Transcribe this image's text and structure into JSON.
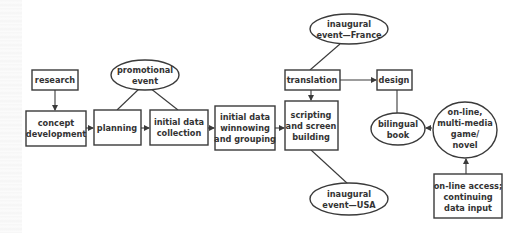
{
  "diagram": {
    "nodes": {
      "research": {
        "shape": "box",
        "lines": [
          "research"
        ]
      },
      "concept_development": {
        "shape": "box",
        "lines": [
          "concept",
          "development"
        ]
      },
      "promotional_event": {
        "shape": "ellipse",
        "lines": [
          "promotional",
          "event"
        ]
      },
      "planning": {
        "shape": "box",
        "lines": [
          "planning"
        ]
      },
      "initial_data_collection": {
        "shape": "box",
        "lines": [
          "initial data",
          "collection"
        ]
      },
      "initial_data_winnowing": {
        "shape": "box",
        "lines": [
          "initial data",
          "winnowing",
          "and grouping"
        ]
      },
      "inaugural_event_france": {
        "shape": "ellipse",
        "lines": [
          "inaugural",
          "event—France"
        ]
      },
      "translation": {
        "shape": "box",
        "lines": [
          "translation"
        ]
      },
      "design": {
        "shape": "box",
        "lines": [
          "design"
        ]
      },
      "scripting": {
        "shape": "box",
        "lines": [
          "scripting",
          "and screen",
          "building"
        ]
      },
      "bilingual_book": {
        "shape": "ellipse",
        "lines": [
          "bilingual",
          "book"
        ]
      },
      "online_game": {
        "shape": "ellipse",
        "lines": [
          "on-line,",
          "multi-media",
          "game/",
          "novel"
        ]
      },
      "online_access": {
        "shape": "box",
        "lines": [
          "on-line access;",
          "continuing",
          "data input"
        ]
      },
      "inaugural_event_usa": {
        "shape": "ellipse",
        "lines": [
          "inaugural",
          "event—USA"
        ]
      }
    },
    "edges": [
      [
        "research",
        "concept_development",
        "arrow"
      ],
      [
        "concept_development",
        "planning",
        "arrow"
      ],
      [
        "planning",
        "initial_data_collection",
        "arrow"
      ],
      [
        "promotional_event",
        "planning",
        "line"
      ],
      [
        "promotional_event",
        "initial_data_collection",
        "line"
      ],
      [
        "initial_data_collection",
        "initial_data_winnowing",
        "arrow"
      ],
      [
        "initial_data_winnowing",
        "scripting",
        "arrow"
      ],
      [
        "inaugural_event_france",
        "translation",
        "line"
      ],
      [
        "translation",
        "scripting",
        "arrow"
      ],
      [
        "translation",
        "design",
        "arrow"
      ],
      [
        "design",
        "bilingual_book",
        "line"
      ],
      [
        "online_game",
        "bilingual_book",
        "arrow"
      ],
      [
        "online_access",
        "online_game",
        "arrow"
      ],
      [
        "scripting",
        "inaugural_event_usa",
        "line"
      ]
    ]
  }
}
